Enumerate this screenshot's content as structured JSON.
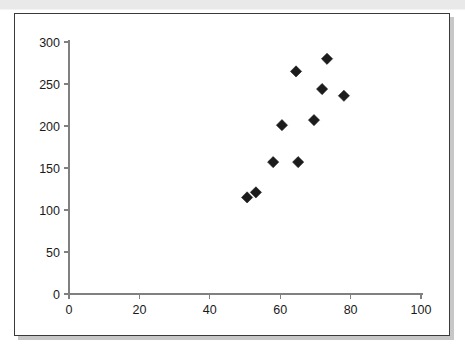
{
  "chart_data": {
    "type": "scatter",
    "title": "",
    "xlabel": "",
    "ylabel": "",
    "xlim": [
      0,
      100
    ],
    "ylim": [
      0,
      300
    ],
    "xticks": [
      0,
      20,
      40,
      60,
      80,
      100
    ],
    "yticks": [
      0,
      50,
      100,
      150,
      200,
      250,
      300
    ],
    "xtick_labels": [
      "0",
      "20",
      "40",
      "60",
      "80",
      "100"
    ],
    "ytick_labels": [
      "0",
      "50",
      "100",
      "150",
      "200",
      "250",
      "300"
    ],
    "grid": false,
    "legend": false,
    "marker": "diamond",
    "marker_color": "#1c1c1c",
    "series": [
      {
        "name": "series-1",
        "points": [
          {
            "x": 50.6,
            "y": 115
          },
          {
            "x": 53.1,
            "y": 121
          },
          {
            "x": 58.0,
            "y": 157
          },
          {
            "x": 60.5,
            "y": 201
          },
          {
            "x": 64.5,
            "y": 265
          },
          {
            "x": 65.1,
            "y": 157
          },
          {
            "x": 69.6,
            "y": 207
          },
          {
            "x": 71.9,
            "y": 244
          },
          {
            "x": 73.3,
            "y": 280
          },
          {
            "x": 78.1,
            "y": 236
          }
        ]
      }
    ]
  },
  "colors": {
    "marker": "#1c1c1c",
    "axis": "#808080",
    "frame_border": "#3a3a3a",
    "panel_background": "#ffffff",
    "top_band": "#e9e9e9"
  }
}
